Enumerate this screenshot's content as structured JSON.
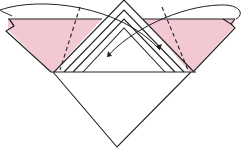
{
  "diagram": {
    "type": "origami-fold-step",
    "colors": {
      "paper_back": "#f2c9d2",
      "paper_front": "#ffffff",
      "line": "#222222"
    },
    "elements": [
      {
        "name": "left-pink-flap",
        "description": "pink colored side of paper, left flap"
      },
      {
        "name": "right-pink-flap",
        "description": "pink colored side of paper, right flap"
      },
      {
        "name": "nested-triangle-layers",
        "description": "stacked triangular layers in center, 4 nested"
      },
      {
        "name": "bottom-white-triangle",
        "description": "white lower triangle of folded square"
      },
      {
        "name": "valley-fold-line-left",
        "description": "dashed fold line on left flap"
      },
      {
        "name": "valley-fold-line-right",
        "description": "dashed fold line on right flap"
      },
      {
        "name": "fold-arrow-left",
        "description": "curved arrow folding left flap behind to the center"
      },
      {
        "name": "fold-arrow-right",
        "description": "curved arrow folding right flap behind to the center"
      }
    ]
  }
}
